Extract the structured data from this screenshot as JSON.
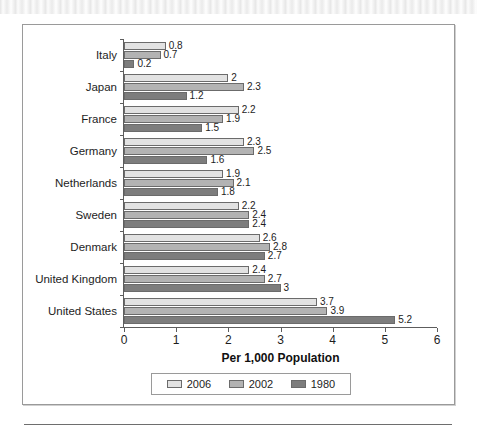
{
  "chart_data": {
    "type": "bar",
    "orientation": "horizontal",
    "title": "",
    "xlabel": "Per 1,000 Population",
    "ylabel": "",
    "xlim": [
      0,
      6
    ],
    "xticks": [
      0,
      1,
      2,
      3,
      4,
      5,
      6
    ],
    "grid": false,
    "legend_position": "bottom",
    "categories": [
      "Italy",
      "Japan",
      "France",
      "Germany",
      "Netherlands",
      "Sweden",
      "Denmark",
      "United Kingdom",
      "United States"
    ],
    "series": [
      {
        "name": "2006",
        "color": "#e2e2e2",
        "values": [
          0.8,
          2,
          2.2,
          2.3,
          1.9,
          2.2,
          2.6,
          2.4,
          3.7
        ]
      },
      {
        "name": "2002",
        "color": "#b3b3b3",
        "values": [
          0.7,
          2.3,
          1.9,
          2.5,
          2.1,
          2.4,
          2.8,
          2.7,
          3.9
        ]
      },
      {
        "name": "1980",
        "color": "#7d7d7d",
        "values": [
          0.2,
          1.2,
          1.5,
          1.6,
          1.8,
          2.4,
          2.7,
          3,
          5.2
        ]
      }
    ],
    "value_labels": {
      "Italy": [
        "0.8",
        "0.7",
        "0.2"
      ],
      "Japan": [
        "2",
        "2.3",
        "1.2"
      ],
      "France": [
        "2.2",
        "1.9",
        "1.5"
      ],
      "Germany": [
        "2.3",
        "2.5",
        "1.6"
      ],
      "Netherlands": [
        "1.9",
        "2.1",
        "1.8"
      ],
      "Sweden": [
        "2.2",
        "2.4",
        "2.4"
      ],
      "Denmark": [
        "2.6",
        "2.8",
        "2.7"
      ],
      "United Kingdom": [
        "2.4",
        "2.7",
        "3"
      ],
      "United States": [
        "3.7",
        "3.9",
        "5.2"
      ]
    }
  },
  "legend": {
    "items": [
      {
        "label": "2006"
      },
      {
        "label": "2002"
      },
      {
        "label": "1980"
      }
    ]
  }
}
